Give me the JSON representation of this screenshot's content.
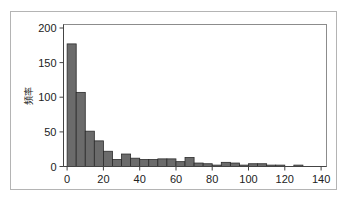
{
  "chart_data": {
    "type": "bar",
    "subtype": "histogram",
    "title": "",
    "subtitle": "",
    "xlabel": "",
    "ylabel": "頻率",
    "xlim": [
      -2,
      143
    ],
    "ylim": [
      0,
      205
    ],
    "grid": false,
    "legend": null,
    "bin_width": 5,
    "bar_fill_color": "#6b6b6b",
    "bar_edge_color": "#2b2b2b",
    "axis_color": "#444444",
    "frame_color": "#b4b4b4",
    "xticks": [
      0,
      20,
      40,
      60,
      80,
      100,
      120,
      140
    ],
    "xtick_labels": [
      "0",
      "20",
      "40",
      "60",
      "80",
      "100",
      "120",
      "140"
    ],
    "yticks": [
      0,
      50,
      100,
      150,
      200
    ],
    "ytick_labels": [
      "0",
      "50",
      "100",
      "150",
      "200"
    ],
    "bin_starts": [
      0,
      5,
      10,
      15,
      20,
      25,
      30,
      35,
      40,
      45,
      50,
      55,
      60,
      65,
      70,
      75,
      80,
      85,
      90,
      95,
      100,
      105,
      110,
      115,
      120,
      125,
      130
    ],
    "categories": [
      "0-5",
      "5-10",
      "10-15",
      "15-20",
      "20-25",
      "25-30",
      "30-35",
      "35-40",
      "40-45",
      "45-50",
      "50-55",
      "55-60",
      "60-65",
      "65-70",
      "70-75",
      "75-80",
      "80-85",
      "85-90",
      "90-95",
      "95-100",
      "100-105",
      "105-110",
      "110-115",
      "115-120",
      "120-125",
      "125-130",
      "130-135"
    ],
    "values": [
      177,
      107,
      51,
      37,
      22,
      10,
      18,
      12,
      10,
      10,
      11,
      11,
      7,
      13,
      5,
      4,
      2,
      6,
      5,
      2,
      4,
      4,
      2,
      2,
      0,
      2,
      0
    ]
  }
}
